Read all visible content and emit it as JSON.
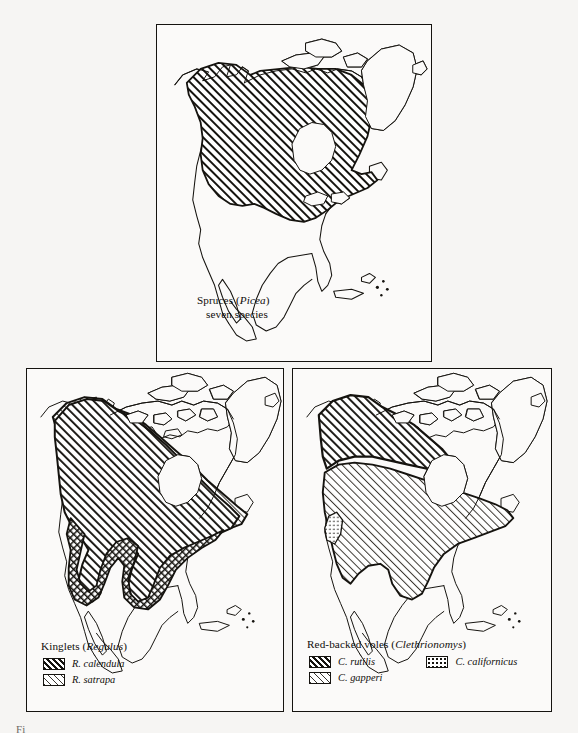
{
  "figure": {
    "label": "Fi",
    "background_color": "#f6f5f3",
    "ink_color": "#15130f"
  },
  "panels": [
    {
      "id": "spruces",
      "caption_line1_plain": "Spruces (",
      "caption_line1_italic": "Picea",
      "caption_line1_close": ")",
      "caption_line2": "seven species",
      "legend": []
    },
    {
      "id": "kinglets",
      "caption_plain": "Kinglets (",
      "caption_italic": "Regulus",
      "caption_close": ")",
      "legend": [
        {
          "label": "R. calendula",
          "pattern": "dense-hatch"
        },
        {
          "label": "R. satrapa",
          "pattern": "light-hatch"
        }
      ]
    },
    {
      "id": "voles",
      "caption_plain": "Red-backed voles (",
      "caption_italic": "Clethrionomys",
      "caption_close": ")",
      "legend_left": [
        {
          "label": "C. rutilis",
          "pattern": "dense-hatch"
        },
        {
          "label": "C. gapperi",
          "pattern": "light-hatch"
        }
      ],
      "legend_right": [
        {
          "label": "C. californicus",
          "pattern": "stipple"
        }
      ]
    }
  ]
}
